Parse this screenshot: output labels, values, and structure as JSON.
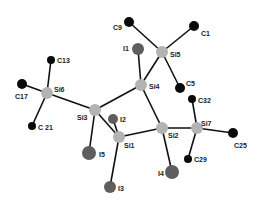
{
  "colors": {
    "carbon": "#0a0a0a",
    "silicon": "#b3b3b3",
    "iodine": "#5e5e5e",
    "bond": "#111111"
  },
  "atoms": [
    {
      "id": "C9",
      "label": "C9",
      "element": "C",
      "x": 129,
      "y": 22,
      "r": 5,
      "lx": 113,
      "ly": 30
    },
    {
      "id": "C1",
      "label": "C1",
      "element": "C",
      "x": 194,
      "y": 26,
      "r": 5,
      "lx": 201,
      "ly": 36
    },
    {
      "id": "Si5",
      "label": "Si5",
      "element": "Si",
      "x": 162,
      "y": 52,
      "r": 6,
      "lx": 170,
      "ly": 57
    },
    {
      "id": "I1",
      "label": "I1",
      "element": "I",
      "x": 138,
      "y": 49,
      "r": 6,
      "lx": 123,
      "ly": 51
    },
    {
      "id": "C5",
      "label": "C5",
      "element": "C",
      "x": 180,
      "y": 88,
      "r": 5,
      "lx": 186,
      "ly": 86
    },
    {
      "id": "Si4",
      "label": "Si4",
      "element": "Si",
      "x": 141,
      "y": 85,
      "r": 6,
      "lx": 149,
      "ly": 89
    },
    {
      "id": "C32",
      "label": "C32",
      "element": "C",
      "x": 192,
      "y": 99,
      "r": 4,
      "lx": 198,
      "ly": 103
    },
    {
      "id": "C13",
      "label": "C13",
      "element": "C",
      "x": 51,
      "y": 60,
      "r": 4,
      "lx": 57,
      "ly": 63
    },
    {
      "id": "Si6",
      "label": "Si6",
      "element": "Si",
      "x": 47,
      "y": 93,
      "r": 6,
      "lx": 54,
      "ly": 92
    },
    {
      "id": "C17",
      "label": "C17",
      "element": "C",
      "x": 22,
      "y": 84,
      "r": 5,
      "lx": 15,
      "ly": 99
    },
    {
      "id": "C21",
      "label": "C 21",
      "element": "C",
      "x": 32,
      "y": 126,
      "r": 4,
      "lx": 38,
      "ly": 130
    },
    {
      "id": "Si3",
      "label": "Si3",
      "element": "Si",
      "x": 95,
      "y": 110,
      "r": 6,
      "lx": 77,
      "ly": 120
    },
    {
      "id": "I2",
      "label": "I2",
      "element": "I",
      "x": 113,
      "y": 119,
      "r": 5,
      "lx": 120,
      "ly": 122
    },
    {
      "id": "Si1",
      "label": "Si1",
      "element": "Si",
      "x": 119,
      "y": 137,
      "r": 6,
      "lx": 124,
      "ly": 148
    },
    {
      "id": "I5",
      "label": "I5",
      "element": "I",
      "x": 89,
      "y": 153,
      "r": 7,
      "lx": 99,
      "ly": 157
    },
    {
      "id": "Si2",
      "label": "Si2",
      "element": "Si",
      "x": 162,
      "y": 128,
      "r": 6,
      "lx": 168,
      "ly": 138
    },
    {
      "id": "Si7",
      "label": "Si7",
      "element": "Si",
      "x": 197,
      "y": 128,
      "r": 6,
      "lx": 201,
      "ly": 126
    },
    {
      "id": "C25",
      "label": "C25",
      "element": "C",
      "x": 233,
      "y": 133,
      "r": 5,
      "lx": 234,
      "ly": 148
    },
    {
      "id": "C29",
      "label": "C29",
      "element": "C",
      "x": 188,
      "y": 159,
      "r": 4,
      "lx": 194,
      "ly": 162
    },
    {
      "id": "I4",
      "label": "I4",
      "element": "I",
      "x": 172,
      "y": 172,
      "r": 7,
      "lx": 158,
      "ly": 176
    },
    {
      "id": "I3",
      "label": "I3",
      "element": "I",
      "x": 110,
      "y": 187,
      "r": 6,
      "lx": 118,
      "ly": 191
    }
  ],
  "bonds": [
    [
      "C9",
      "Si5"
    ],
    [
      "C1",
      "Si5"
    ],
    [
      "Si5",
      "C5"
    ],
    [
      "Si5",
      "Si4"
    ],
    [
      "I1",
      "Si4"
    ],
    [
      "Si4",
      "Si3"
    ],
    [
      "Si4",
      "Si2"
    ],
    [
      "C13",
      "Si6"
    ],
    [
      "C17",
      "Si6"
    ],
    [
      "Si6",
      "C21"
    ],
    [
      "Si6",
      "Si3"
    ],
    [
      "Si3",
      "I5"
    ],
    [
      "Si3",
      "Si1"
    ],
    [
      "I2",
      "Si1"
    ],
    [
      "Si1",
      "I3"
    ],
    [
      "Si1",
      "Si2"
    ],
    [
      "Si2",
      "I4"
    ],
    [
      "Si2",
      "Si7"
    ],
    [
      "Si7",
      "C32"
    ],
    [
      "Si7",
      "C25"
    ],
    [
      "Si7",
      "C29"
    ]
  ]
}
